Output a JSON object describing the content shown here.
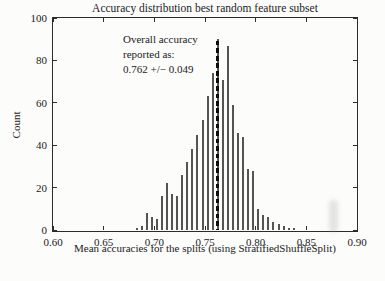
{
  "figure": {
    "background": "#fcfcfb",
    "axis_color": "#2b2b2b",
    "text_color": "#1b1b1b"
  },
  "annotation": {
    "lines": [
      "Overall accuracy",
      "reported as:",
      "0.762 +/− 0.049"
    ]
  },
  "chart_data": {
    "type": "bar",
    "subtype": "histogram",
    "title": "Accuracy distribution best random feature subset",
    "xlabel": "Mean accuracies for the splits (using StratifiedShuffleSplit)",
    "ylabel": "Count",
    "xlim": [
      0.6,
      0.9
    ],
    "ylim": [
      0,
      100
    ],
    "x_tick_values": [
      0.6,
      0.65,
      0.7,
      0.75,
      0.8,
      0.85,
      0.9
    ],
    "x_tick_labels": [
      "0.60",
      "0.65",
      "0.70",
      "0.75",
      "0.80",
      "0.85",
      "0.90"
    ],
    "y_tick_values": [
      0,
      20,
      40,
      60,
      80,
      100
    ],
    "y_tick_labels": [
      "0",
      "20",
      "40",
      "60",
      "80",
      "100"
    ],
    "grid": false,
    "legend": null,
    "bar_color": "#545454",
    "bin_width": 0.005,
    "bin_centers": [
      0.6825,
      0.6875,
      0.6925,
      0.6975,
      0.7025,
      0.7075,
      0.7125,
      0.7175,
      0.7225,
      0.7275,
      0.7325,
      0.7375,
      0.7425,
      0.7475,
      0.7525,
      0.7575,
      0.7625,
      0.7675,
      0.7725,
      0.7775,
      0.7825,
      0.7875,
      0.7925,
      0.7975,
      0.8025,
      0.8075,
      0.8125,
      0.8175,
      0.8225,
      0.8275,
      0.8325,
      0.8375
    ],
    "counts": [
      1,
      2,
      8,
      6,
      5,
      16,
      22,
      17,
      16,
      26,
      32,
      38,
      45,
      52,
      63,
      74,
      90,
      71,
      87,
      59,
      46,
      44,
      29,
      28,
      10,
      7,
      6,
      4,
      3,
      2,
      1,
      1
    ],
    "marker_line": {
      "x": 0.762,
      "top_count": 89,
      "style": "dashed",
      "color": "#0d0d0d",
      "meaning": "overall reported accuracy"
    }
  }
}
